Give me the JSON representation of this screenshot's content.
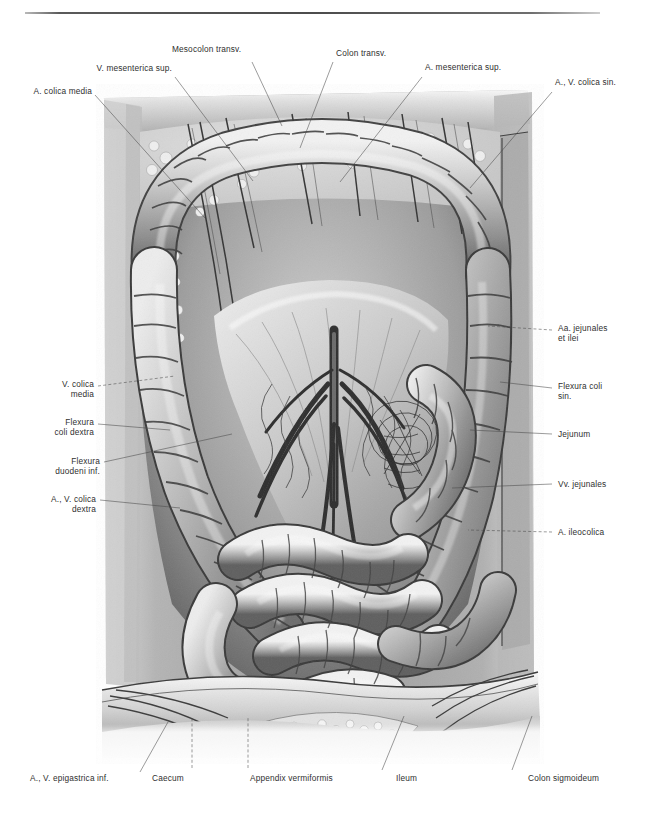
{
  "figure": {
    "kind": "anatomical-plate",
    "technique": "grayscale pencil / airbrush halftone illustration",
    "style": {
      "background": "#ffffff",
      "ink": "#2f2f2f",
      "leader_line": "#4a4a4a",
      "rule": "#4c4c4c"
    }
  },
  "labels": {
    "top": [
      {
        "id": "a-colica-media",
        "text": "A. colica media",
        "lines": [
          "A. colica media"
        ]
      },
      {
        "id": "v-mesenterica-sup",
        "text": "V. mesenterica sup.",
        "lines": [
          "V. mesenterica sup."
        ]
      },
      {
        "id": "mesocolon-transv",
        "text": "Mesocolon transv.",
        "lines": [
          "Mesocolon transv."
        ]
      },
      {
        "id": "colon-transv",
        "text": "Colon transv.",
        "lines": [
          "Colon transv."
        ]
      },
      {
        "id": "a-mesenterica-sup",
        "text": "A. mesenterica sup.",
        "lines": [
          "A. mesenterica sup."
        ]
      },
      {
        "id": "a-v-colica-sin",
        "text": "A., V. colica sin.",
        "lines": [
          "A., V. colica sin."
        ]
      }
    ],
    "left": [
      {
        "id": "v-colica-media",
        "line1": "V. colica",
        "line2": "media"
      },
      {
        "id": "flexura-coli-dextra",
        "line1": "Flexura",
        "line2": "coli dextra"
      },
      {
        "id": "flexura-duodeni-inf",
        "line1": "Flexura",
        "line2": "duodeni inf."
      },
      {
        "id": "a-v-colica-dextra",
        "line1": "A., V. colica",
        "line2": "dextra"
      }
    ],
    "right": [
      {
        "id": "aa-jejunales-et-ilei",
        "line1": "Aa. jejunales",
        "line2": "et ilei"
      },
      {
        "id": "flexura-coli-sin",
        "line1": "Flexura coli",
        "line2": "sin."
      },
      {
        "id": "jejunum",
        "line1": "Jejunum",
        "line2": ""
      },
      {
        "id": "vv-jejunales",
        "line1": "Vv. jejunales",
        "line2": ""
      },
      {
        "id": "a-ileocolica",
        "line1": "A. ileocolica",
        "line2": ""
      }
    ],
    "bottom": [
      {
        "id": "a-v-epigastrica-inf",
        "text": "A., V. epigastrica inf."
      },
      {
        "id": "caecum",
        "text": "Caecum"
      },
      {
        "id": "appendix-vermiformis",
        "text": "Appendix vermiformis"
      },
      {
        "id": "ileum",
        "text": "Ileum"
      },
      {
        "id": "colon-sigmoideum",
        "text": "Colon sigmoideum"
      }
    ]
  }
}
